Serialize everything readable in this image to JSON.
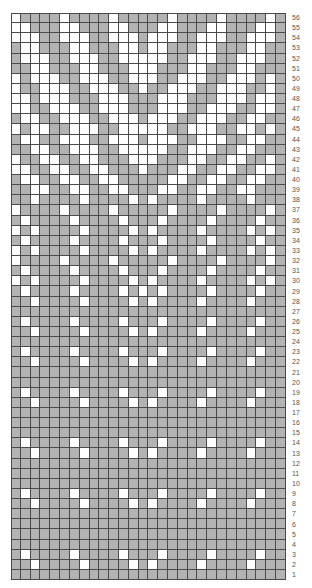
{
  "chart": {
    "title": "",
    "columns": 28,
    "row_count": 56,
    "colors": {
      "contrast": "#b3b3b3",
      "main": "#ffffff",
      "gridline": "#4a4a4a"
    },
    "legend_note": "Row numbers run 1 (bottom) to 56 (top) on the right edge",
    "rows_top_to_bottom": [
      {
        "n": "56",
        "c": "WGGGGWGGGGWGGGGGWGGGGWGGGGWG"
      },
      {
        "n": "55",
        "c": "WWGGGWWGGGWWGGGWWGGGWWGGGWWG"
      },
      {
        "n": "54",
        "c": "WWWGGWWWGGWWWGWWWGGWWWGGWWWG"
      },
      {
        "n": "53",
        "c": "GWWGGGWWGGGWWGWWGGGWWGGGWWGG"
      },
      {
        "n": "52",
        "c": "GWWWGGWWWGGWWWWWGGWWWGGWWWGG"
      },
      {
        "n": "51",
        "c": "GGWWGGGWWGGGWWWGGGWWGGGWWGGG"
      },
      {
        "n": "50",
        "c": "WGWWWGGWWWGGWWWGGWWWGGWWWGWG"
      },
      {
        "n": "49",
        "c": "WGGWWWGGWWWGGWGGWWWGGWWWGGWG"
      },
      {
        "n": "48",
        "c": "WWGWWWGGGWWWGGGWWWGGGWWWGWWG"
      },
      {
        "n": "47",
        "c": "WWGGWWWGGWWWGGGWWWGGWWWGGWWG"
      },
      {
        "n": "46",
        "c": "GWWGGWWWGGWWWGWWWGGWWWGGWWGG"
      },
      {
        "n": "45",
        "c": "WGWWGGWWWGGWWWWWGGWWWGGWWGWG"
      },
      {
        "n": "44",
        "c": "GWWGGWWWGGWWWGWWWGGWWWGGWWGG"
      },
      {
        "n": "43",
        "c": "GGWWGGWWWGGWWWWWGGWWWGGWWGGG"
      },
      {
        "n": "42",
        "c": "WGGWWGGWWGGGWWWGGGWWGGWWGGWG"
      },
      {
        "n": "41",
        "c": "WWGGWWGGWWGGGWGGGWWGGWWGGWWG"
      },
      {
        "n": "40",
        "c": "GWWGGWWGGWWGGGGGWWGGWWGGWWGG"
      },
      {
        "n": "39",
        "c": "GGWWGGWWGGWWGGGWWGGWWGGWWGGG"
      },
      {
        "n": "38",
        "c": "GGWGGGGWGGGGWGWGGGGWGGGGWGGG"
      },
      {
        "n": "37",
        "c": "WGGGGWGGGGWGGGGGWGGGGWGGGGWG"
      },
      {
        "n": "36",
        "c": "GWGGGGWGGGGWGGGWGGGGWGGGGWGG"
      },
      {
        "n": "35",
        "c": "WGWGGGGWGGGGWGWGGGGWGGGGWGWG"
      },
      {
        "n": "34",
        "c": "GWGGGGWGGGGWGGGWGGGGWGGGGWGG"
      },
      {
        "n": "33",
        "c": "WGWGGGGWGGGGWGWGGGGWGGGGWGWG"
      },
      {
        "n": "32",
        "c": "WGGGGWGGGGWGGGGGWGGGGWGGGGWG"
      },
      {
        "n": "31",
        "c": "GWGGGGWGGGGWGGGWGGGGWGGGGWGG"
      },
      {
        "n": "30",
        "c": "WGWGGGGWGGGGWGWGGGGWGGGGWGWG"
      },
      {
        "n": "29",
        "c": "GWGGGGWGGGGWGWGWGGGGWGGGGWGG"
      },
      {
        "n": "28",
        "c": "GGWGGGGWGGGGWGWGGGGWGGGGWGGG"
      },
      {
        "n": "27",
        "c": "GGGGGGGGGGGGGGGGGGGGGGGGGGGG"
      },
      {
        "n": "26",
        "c": "GWGGGGWGGGGWGGGWGGGGWGGGGWGG"
      },
      {
        "n": "25",
        "c": "GGWGGGGWGGGGWGWGGGGWGGGGWGGG"
      },
      {
        "n": "24",
        "c": "GGGGGGGGGGGGGGGGGGGGGGGGGGGG"
      },
      {
        "n": "23",
        "c": "GWGGGGWGGGGWGGGWGGGGWGGGGWGG"
      },
      {
        "n": "22",
        "c": "GGWGGGGWGGGGWGWGGGGWGGGGWGGG"
      },
      {
        "n": "21",
        "c": "GGGGGGGGGGGGGGGGGGGGGGGGGGGG"
      },
      {
        "n": "20",
        "c": "GGGGGGGGGGGGGGGGGGGGGGGGGGGG"
      },
      {
        "n": "19",
        "c": "GWGGGGWGGGGWGGGWGGGGWGGGGWGG"
      },
      {
        "n": "18",
        "c": "GGWGGGGWGGGGWGWGGGGWGGGGWGGG"
      },
      {
        "n": "17",
        "c": "GGGGGGGGGGGGGGGGGGGGGGGGGGGG"
      },
      {
        "n": "16",
        "c": "GGGGGGGGGGGGGGGGGGGGGGGGGGGG"
      },
      {
        "n": "15",
        "c": "GGGGGGGGGGGGGGGGGGGGGGGGGGGG"
      },
      {
        "n": "14",
        "c": "GWGGGGWGGGGWGGGWGGGGWGGGGWGG"
      },
      {
        "n": "13",
        "c": "GGWGGGGWGGGGWGWGGGGWGGGGWGGG"
      },
      {
        "n": "12",
        "c": "GGGGGGGGGGGGGGGGGGGGGGGGGGGG"
      },
      {
        "n": "11",
        "c": "GGGGGGGGGGGGGGGGGGGGGGGGGGGG"
      },
      {
        "n": "10",
        "c": "GGGGGGGGGGGGGGGGGGGGGGGGGGGG"
      },
      {
        "n": "9",
        "c": "GWGGGGWGGGGWGGGWGGGGWGGGGWGG"
      },
      {
        "n": "8",
        "c": "GGWGGGGWGGGGWGWGGGGWGGGGWGGG"
      },
      {
        "n": "7",
        "c": "GGGGGGGGGGGGGGGGGGGGGGGGGGGG"
      },
      {
        "n": "6",
        "c": "GGGGGGGGGGGGGGGGGGGGGGGGGGGG"
      },
      {
        "n": "5",
        "c": "GGGGGGGGGGGGGGGGGGGGGGGGGGGG"
      },
      {
        "n": "4",
        "c": "GGGGGGGGGGGGGGGGGGGGGGGGGGGG"
      },
      {
        "n": "3",
        "c": "GWGGGGWGGGGWGGGWGGGGWGGGGWGG"
      },
      {
        "n": "2",
        "c": "GGWGGGGWGGGGWGWGGGGWGGGGWGGG"
      },
      {
        "n": "1",
        "c": "GGGGGGGGGGGGGGGGGGGGGGGGGGGG"
      }
    ]
  }
}
